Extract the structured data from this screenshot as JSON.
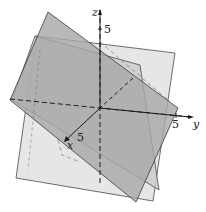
{
  "figure": {
    "type": "3D diagram of three intersecting planes",
    "axes": {
      "x": {
        "label": "x",
        "tick": "5"
      },
      "y": {
        "label": "y",
        "tick": "5"
      },
      "z": {
        "label": "z",
        "tick": "5"
      }
    },
    "planes": [
      {
        "name": "light-plane",
        "color": "#e6e6e6"
      },
      {
        "name": "medium-plane",
        "color": "#cfcfcf"
      },
      {
        "name": "dark-plane",
        "color": "#a9a9a9"
      }
    ],
    "edge_color": "#3a3a3a",
    "axis_color": "#1a1a1a"
  }
}
